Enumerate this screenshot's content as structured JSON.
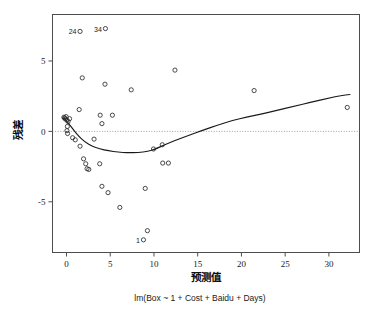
{
  "chart_data": {
    "type": "scatter",
    "title": "",
    "subtitle": "lm(Box ~ 1 + Cost + Baidu + Days)",
    "xlabel": "预测值",
    "ylabel": "残差",
    "xlim": [
      -1.6,
      33.5
    ],
    "ylim": [
      -8.6,
      8.3
    ],
    "xticks": [
      0,
      5,
      10,
      15,
      20,
      25,
      30
    ],
    "xtick_labels": [
      "0",
      "5",
      "10",
      "15",
      "20",
      "25",
      "30"
    ],
    "yticks": [
      5,
      0,
      -5
    ],
    "ytick_labels": [
      "5",
      "0",
      "-5"
    ],
    "grid": false,
    "legend": "none",
    "zero_reference_line": {
      "y": 0,
      "style": "dotted",
      "color": "#9a9a9a"
    },
    "marker": {
      "shape": "open-circle",
      "radius": 2.1,
      "color": "#2b2b2b"
    },
    "points": [
      {
        "x": 1.55,
        "y": 7.1,
        "label": "24"
      },
      {
        "x": 4.45,
        "y": 7.3,
        "label": "34"
      },
      {
        "x": 8.8,
        "y": -7.7,
        "label": "1"
      },
      {
        "x": -0.3,
        "y": 1.0
      },
      {
        "x": -0.22,
        "y": 0.95
      },
      {
        "x": -0.12,
        "y": 0.88
      },
      {
        "x": -0.05,
        "y": 1.05
      },
      {
        "x": 0.05,
        "y": 0.8
      },
      {
        "x": 0.18,
        "y": 0.7
      },
      {
        "x": 0.35,
        "y": 0.9
      },
      {
        "x": 0.1,
        "y": 0.35
      },
      {
        "x": 0.05,
        "y": 0.05
      },
      {
        "x": 0.12,
        "y": -0.15
      },
      {
        "x": 0.7,
        "y": -0.45
      },
      {
        "x": 1.0,
        "y": -0.6
      },
      {
        "x": 1.45,
        "y": 1.55
      },
      {
        "x": 1.8,
        "y": 3.8
      },
      {
        "x": 1.55,
        "y": -1.05
      },
      {
        "x": 1.95,
        "y": -1.95
      },
      {
        "x": 2.2,
        "y": -2.3
      },
      {
        "x": 2.35,
        "y": -2.65
      },
      {
        "x": 2.55,
        "y": -2.7
      },
      {
        "x": 3.15,
        "y": -0.55
      },
      {
        "x": 3.85,
        "y": 1.15
      },
      {
        "x": 4.05,
        "y": 0.55
      },
      {
        "x": 4.4,
        "y": 3.35
      },
      {
        "x": 5.25,
        "y": 1.15
      },
      {
        "x": 3.8,
        "y": -2.3
      },
      {
        "x": 4.05,
        "y": -3.9
      },
      {
        "x": 4.75,
        "y": -4.35
      },
      {
        "x": 6.1,
        "y": -5.4
      },
      {
        "x": 7.4,
        "y": 2.95
      },
      {
        "x": 9.0,
        "y": -4.05
      },
      {
        "x": 9.25,
        "y": -7.05
      },
      {
        "x": 9.95,
        "y": -1.25
      },
      {
        "x": 10.95,
        "y": -0.95
      },
      {
        "x": 11.0,
        "y": -2.25
      },
      {
        "x": 11.65,
        "y": -2.25
      },
      {
        "x": 12.4,
        "y": 4.35
      },
      {
        "x": 21.45,
        "y": 2.9
      },
      {
        "x": 32.1,
        "y": 1.7
      }
    ],
    "loess_curve": [
      {
        "x": -0.35,
        "y": 0.95
      },
      {
        "x": 0.2,
        "y": 0.6
      },
      {
        "x": 0.8,
        "y": 0.1
      },
      {
        "x": 1.4,
        "y": -0.35
      },
      {
        "x": 2.1,
        "y": -0.75
      },
      {
        "x": 2.9,
        "y": -1.05
      },
      {
        "x": 3.8,
        "y": -1.25
      },
      {
        "x": 4.8,
        "y": -1.38
      },
      {
        "x": 5.9,
        "y": -1.48
      },
      {
        "x": 7.0,
        "y": -1.52
      },
      {
        "x": 8.2,
        "y": -1.5
      },
      {
        "x": 9.3,
        "y": -1.42
      },
      {
        "x": 10.2,
        "y": -1.25
      },
      {
        "x": 11.2,
        "y": -0.95
      },
      {
        "x": 12.5,
        "y": -0.62
      },
      {
        "x": 14.0,
        "y": -0.28
      },
      {
        "x": 15.6,
        "y": 0.08
      },
      {
        "x": 17.3,
        "y": 0.45
      },
      {
        "x": 19.0,
        "y": 0.78
      },
      {
        "x": 20.6,
        "y": 1.02
      },
      {
        "x": 22.2,
        "y": 1.22
      },
      {
        "x": 24.0,
        "y": 1.48
      },
      {
        "x": 26.0,
        "y": 1.78
      },
      {
        "x": 28.0,
        "y": 2.08
      },
      {
        "x": 30.0,
        "y": 2.36
      },
      {
        "x": 31.4,
        "y": 2.55
      },
      {
        "x": 32.4,
        "y": 2.62
      }
    ]
  }
}
